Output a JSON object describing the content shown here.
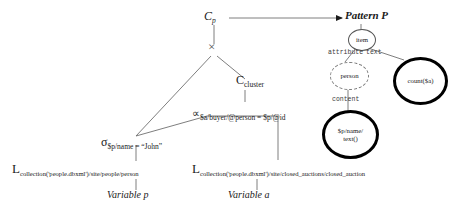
{
  "figure": {
    "type": "query-plan-tree"
  },
  "plan_tree": {
    "root": {
      "label": "C",
      "subscript": "p",
      "name": "construct-operator"
    },
    "cross": {
      "symbol": "×",
      "name": "cross-product-operator"
    },
    "cluster": {
      "label": "C",
      "subscript": "cluster",
      "name": "cluster-construct-operator"
    },
    "join": {
      "symbol": "∝",
      "subscript": "$a/buyer/@person = $p/@id",
      "name": "join-operator"
    },
    "select": {
      "symbol": "σ",
      "subscript": "$p/name = “John”",
      "name": "selection-operator"
    },
    "leaves": [
      {
        "symbol": "L",
        "subscript": "collection('people.dbxml')/site/people/person",
        "variable": "Variable p",
        "name": "loader-left"
      },
      {
        "symbol": "L",
        "subscript": "collection('people.dbxml')/site/closed_auctions/closed_auction",
        "variable": "Variable a",
        "name": "loader-right"
      }
    ]
  },
  "pattern_tree": {
    "title": "Pattern P",
    "nodes": [
      {
        "id": "item",
        "label": "item",
        "style": "solid",
        "name": "pattern-node-item"
      },
      {
        "id": "person",
        "label": "person",
        "style": "dashed",
        "name": "pattern-node-person"
      },
      {
        "id": "count",
        "label": "count($a)",
        "style": "bold",
        "name": "pattern-node-count"
      },
      {
        "id": "pname",
        "label": "$p/name/",
        "label2": "text()",
        "style": "bold",
        "name": "pattern-node-pname"
      }
    ],
    "edges": [
      {
        "label": "attribute",
        "name": "edge-label-attribute"
      },
      {
        "label": "text",
        "name": "edge-label-text"
      },
      {
        "label": "content",
        "name": "edge-label-content"
      }
    ]
  },
  "colors": {
    "line": "#6f6f6f",
    "bold_node": "#000000",
    "text": "#1a1a1a"
  }
}
